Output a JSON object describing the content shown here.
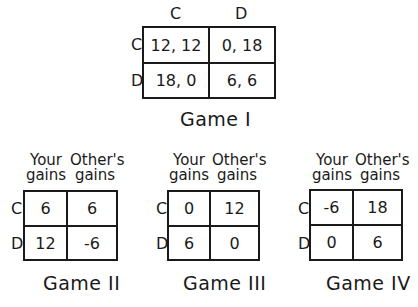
{
  "game1": {
    "title": "Game I",
    "col_headers": [
      "C",
      "D"
    ],
    "row_headers": [
      "C",
      "D"
    ],
    "cells": [
      [
        "12, 12",
        "0, 18"
      ],
      [
        "18, 0",
        "6, 6"
      ]
    ]
  },
  "game2": {
    "title": "Game II",
    "col_headers": [
      "Your gains",
      "Other's gains"
    ],
    "col_headers_split": [
      [
        "Your",
        "gains"
      ],
      [
        "Other's",
        "gains"
      ]
    ],
    "row_headers": [
      "C",
      "D"
    ],
    "cells": [
      [
        "6",
        "6"
      ],
      [
        "12",
        "-6"
      ]
    ]
  },
  "game3": {
    "title": "Game III",
    "col_headers": [
      "Your gains",
      "Other's gains"
    ],
    "col_headers_split": [
      [
        "Your",
        "gains"
      ],
      [
        "Other's",
        "gains"
      ]
    ],
    "row_headers": [
      "C",
      "D"
    ],
    "cells": [
      [
        "0",
        "12"
      ],
      [
        "6",
        "0"
      ]
    ]
  },
  "game4": {
    "title": "Game IV",
    "col_headers": [
      "Your gains",
      "Other's gains"
    ],
    "col_headers_split": [
      [
        "Your",
        "gains"
      ],
      [
        "Other's",
        "gains"
      ]
    ],
    "row_headers": [
      "C",
      "D"
    ],
    "cells": [
      [
        "-6",
        "18"
      ],
      [
        "0",
        "6"
      ]
    ]
  }
}
